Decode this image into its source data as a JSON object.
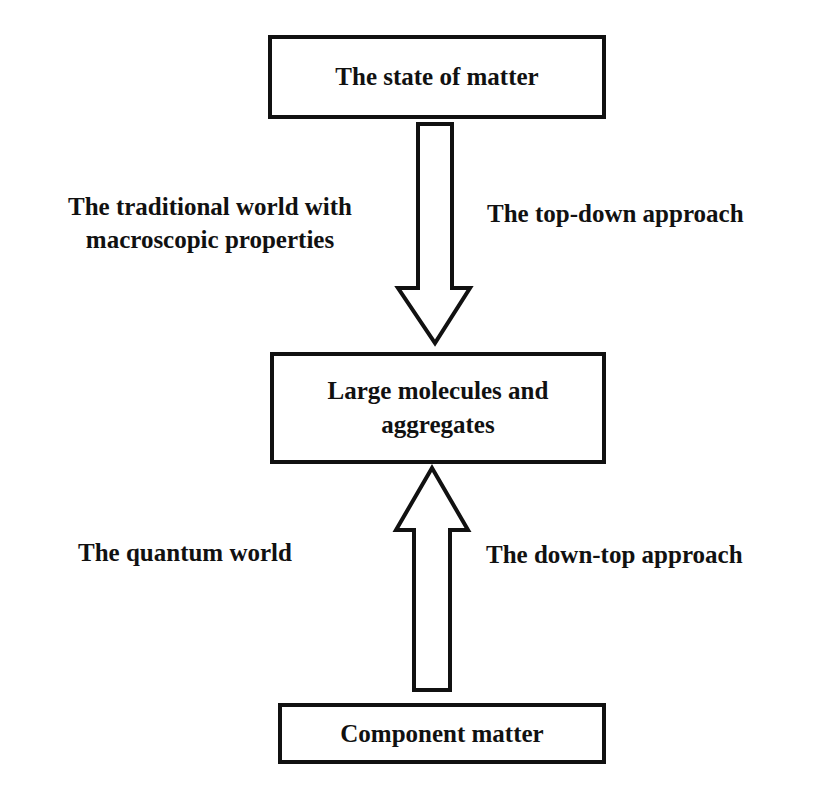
{
  "diagram": {
    "nodes": [
      {
        "id": "top",
        "label": "The state of matter"
      },
      {
        "id": "middle",
        "label_lines": [
          "Large molecules and",
          "aggregates"
        ]
      },
      {
        "id": "bottom",
        "label": "Component matter"
      }
    ],
    "edges": [
      {
        "from": "top",
        "to": "middle",
        "direction": "down",
        "left_label_lines": [
          "The traditional world with",
          "macroscopic properties"
        ],
        "right_label": "The top-down approach"
      },
      {
        "from": "bottom",
        "to": "middle",
        "direction": "up",
        "left_label": "The quantum world",
        "right_label": "The down-top approach"
      }
    ]
  },
  "colors": {
    "stroke": "#111111",
    "fill": "#ffffff",
    "background": "#ffffff"
  }
}
